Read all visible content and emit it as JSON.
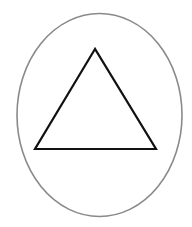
{
  "canvas": {
    "width": 192,
    "height": 227,
    "background": "#ffffff"
  },
  "shapes": {
    "ellipse": {
      "name": "outer-ellipse",
      "cx": 99.5,
      "cy": 115,
      "rx": 82.5,
      "ry": 101.5,
      "stroke": "#8a8a8a",
      "stroke_width": 1.6,
      "fill": "none"
    },
    "triangle": {
      "name": "inner-triangle",
      "points": "95,49 35,149 156,149",
      "stroke": "#111111",
      "stroke_width": 2.2,
      "fill": "none"
    }
  }
}
